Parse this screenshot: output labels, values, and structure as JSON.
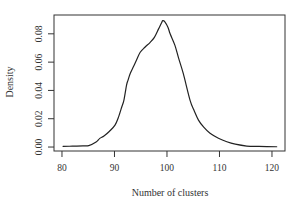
{
  "chart_data": {
    "type": "line",
    "title": "",
    "xlabel": "Number of clusters",
    "ylabel": "Density",
    "xlim": [
      78.48,
      122.48
    ],
    "ylim": [
      -0.0028,
      0.0933
    ],
    "x_ticks": [
      80,
      90,
      100,
      110,
      120
    ],
    "x_tick_labels": [
      "80",
      "90",
      "100",
      "110",
      "120"
    ],
    "y_ticks": [
      0.0,
      0.02,
      0.04,
      0.06,
      0.08
    ],
    "y_tick_labels": [
      "0.00",
      "0.02",
      "0.04",
      "0.06",
      "0.08"
    ],
    "grid": false,
    "legend": null,
    "series": [
      {
        "name": "density",
        "color": "#222222",
        "x": [
          80.2,
          82,
          84,
          85.1,
          86.5,
          87.2,
          88.0,
          89.0,
          90.1,
          90.8,
          91.4,
          91.8,
          92.3,
          92.6,
          93.0,
          93.6,
          94.2,
          94.9,
          95.8,
          96.8,
          97.6,
          98.4,
          99.0,
          99.2,
          99.6,
          100.2,
          100.6,
          101.5,
          102.2,
          103.1,
          104.4,
          105.2,
          106.0,
          107.0,
          108.2,
          109.8,
          111.4,
          113.0,
          115.2,
          117.5,
          120.9
        ],
        "y": [
          0.0005,
          0.0006,
          0.0008,
          0.001,
          0.0035,
          0.0061,
          0.0078,
          0.011,
          0.0155,
          0.0215,
          0.0285,
          0.0332,
          0.0438,
          0.0475,
          0.052,
          0.0567,
          0.0615,
          0.067,
          0.0705,
          0.074,
          0.0775,
          0.0835,
          0.088,
          0.0893,
          0.0885,
          0.0845,
          0.08,
          0.072,
          0.063,
          0.052,
          0.033,
          0.0255,
          0.019,
          0.014,
          0.0097,
          0.0062,
          0.0037,
          0.002,
          0.0007,
          0.0004,
          0.0002
        ]
      }
    ]
  },
  "layout": {
    "plot_box": {
      "left": 54,
      "top": 15,
      "right": 285,
      "bottom": 151
    },
    "frame_color": "#333333",
    "text_color": "#333333"
  }
}
